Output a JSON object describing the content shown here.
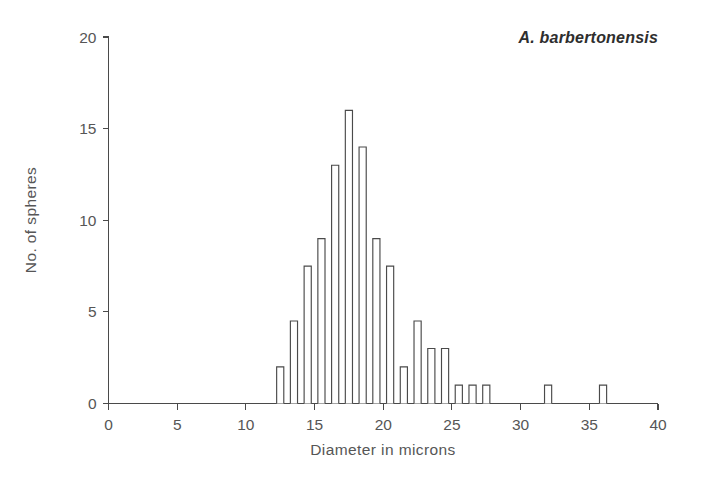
{
  "chart_data": {
    "type": "bar",
    "title": "A. barbertonensis",
    "xlabel": "Diameter in microns",
    "ylabel": "No. of spheres",
    "xlim": [
      0,
      40
    ],
    "ylim": [
      0,
      20
    ],
    "xticks": [
      0,
      5,
      10,
      15,
      20,
      25,
      30,
      35,
      40
    ],
    "yticks": [
      0,
      5,
      10,
      15,
      20
    ],
    "grid": false,
    "legend": "none",
    "bin_width": 1,
    "bar_style": "open outline, white fill, thin dark stroke",
    "categories": [
      12.5,
      13.5,
      14.5,
      15.5,
      16.5,
      17.5,
      18.5,
      19.5,
      20.5,
      21.5,
      22.5,
      23.5,
      24.5,
      25.5,
      26.5,
      27.5,
      32,
      36
    ],
    "values": [
      2,
      4.5,
      7.5,
      9,
      13,
      16,
      14,
      9,
      7.5,
      2,
      4.5,
      3,
      3,
      1,
      1,
      1,
      1,
      1
    ],
    "bars": [
      {
        "x": 12.5,
        "y": 2
      },
      {
        "x": 13.5,
        "y": 4.5
      },
      {
        "x": 14.5,
        "y": 7.5
      },
      {
        "x": 15.5,
        "y": 9
      },
      {
        "x": 16.5,
        "y": 13
      },
      {
        "x": 17.5,
        "y": 16
      },
      {
        "x": 18.5,
        "y": 14
      },
      {
        "x": 19.5,
        "y": 9
      },
      {
        "x": 20.5,
        "y": 7.5
      },
      {
        "x": 21.5,
        "y": 2
      },
      {
        "x": 22.5,
        "y": 4.5
      },
      {
        "x": 23.5,
        "y": 3
      },
      {
        "x": 24.5,
        "y": 3
      },
      {
        "x": 25.5,
        "y": 1
      },
      {
        "x": 26.5,
        "y": 1
      },
      {
        "x": 27.5,
        "y": 1
      },
      {
        "x": 32.0,
        "y": 1
      },
      {
        "x": 36.0,
        "y": 1
      }
    ]
  },
  "colors": {
    "background": "#ffffff",
    "axis": "#4a4a4a",
    "text": "#565656",
    "title_text": "#2e2e2e",
    "bar_fill": "#ffffff",
    "bar_stroke": "#4a4a4a"
  },
  "xticklabels": [
    "0",
    "5",
    "10",
    "15",
    "20",
    "25",
    "30",
    "35",
    "40"
  ],
  "yticklabels": [
    "0",
    "5",
    "10",
    "15",
    "20"
  ],
  "axis_titles": {
    "x": "Diameter in microns",
    "y": "No. of spheres"
  },
  "species_label": "A. barbertonensis"
}
